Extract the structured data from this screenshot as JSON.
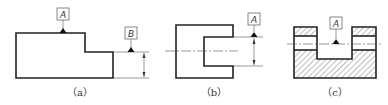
{
  "figures": [
    {
      "id": "a",
      "caption": "（a）",
      "datums": [
        "A",
        "B"
      ]
    },
    {
      "id": "b",
      "caption": "（b）",
      "datums": [
        "A"
      ]
    },
    {
      "id": "c",
      "caption": "（c）",
      "datums": [
        "A"
      ]
    }
  ],
  "colors": {
    "line": "#222222",
    "thin": "#555555",
    "background": "#ffffff"
  }
}
